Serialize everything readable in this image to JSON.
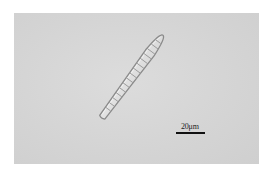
{
  "image": {
    "subject": "diatom micrograph",
    "background_color": "#d6d6d6"
  },
  "scale_bar": {
    "label": "20μm"
  }
}
